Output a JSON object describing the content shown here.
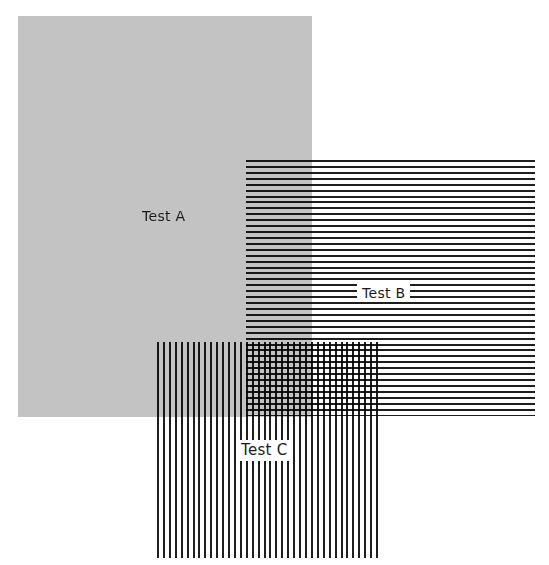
{
  "figure": {
    "panels": [
      {
        "id": "A",
        "label": "Test A",
        "pattern": "solid-gray",
        "color": "#c3c3c3"
      },
      {
        "id": "B",
        "label": "Test B",
        "pattern": "horizontal-lines",
        "color": "#1e1e1e"
      },
      {
        "id": "C",
        "label": "Test C",
        "pattern": "vertical-lines",
        "color": "#1e1e1e"
      }
    ]
  }
}
